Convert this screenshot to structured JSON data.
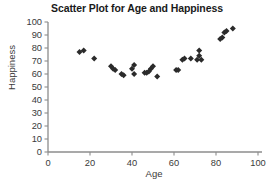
{
  "chart_data": {
    "type": "scatter",
    "title": "Scatter Plot for Age and Happiness",
    "xlabel": "Age",
    "ylabel": "Happiness",
    "xlim": [
      0,
      100
    ],
    "ylim": [
      0,
      100
    ],
    "xticks": [
      0,
      20,
      40,
      60,
      80,
      100
    ],
    "yticks": [
      0,
      10,
      20,
      30,
      40,
      50,
      60,
      70,
      80,
      90,
      100
    ],
    "grid": false,
    "legend": null,
    "marker": "diamond",
    "marker_color": "#2b2b2b",
    "series": [
      {
        "name": "Age vs Happiness",
        "points": [
          [
            15,
            77
          ],
          [
            17,
            78
          ],
          [
            22,
            72
          ],
          [
            30,
            66
          ],
          [
            31,
            64
          ],
          [
            32,
            63
          ],
          [
            35,
            60
          ],
          [
            36,
            59
          ],
          [
            40,
            64
          ],
          [
            41,
            67
          ],
          [
            41,
            60
          ],
          [
            46,
            61
          ],
          [
            47,
            61
          ],
          [
            48,
            62
          ],
          [
            49,
            64
          ],
          [
            50,
            66
          ],
          [
            52,
            58
          ],
          [
            61,
            63
          ],
          [
            62,
            63
          ],
          [
            64,
            71
          ],
          [
            65,
            72
          ],
          [
            68,
            72
          ],
          [
            71,
            71
          ],
          [
            72,
            74
          ],
          [
            72,
            78
          ],
          [
            73,
            71
          ],
          [
            82,
            87
          ],
          [
            83,
            88
          ],
          [
            84,
            92
          ],
          [
            85,
            93
          ],
          [
            88,
            95
          ]
        ]
      }
    ]
  },
  "axes": {
    "x_label": "Age",
    "y_label": "Happiness",
    "x_tick_labels": [
      "0",
      "20",
      "40",
      "60",
      "80",
      "100"
    ],
    "y_tick_labels": [
      "0",
      "10",
      "20",
      "30",
      "40",
      "50",
      "60",
      "70",
      "80",
      "90",
      "100"
    ]
  },
  "style": {
    "axis_color": "#8c8c8c",
    "marker_color": "#2b2b2b",
    "title_color": "#1a1a1a",
    "text_color": "#3a3a3a",
    "background": "#ffffff"
  }
}
